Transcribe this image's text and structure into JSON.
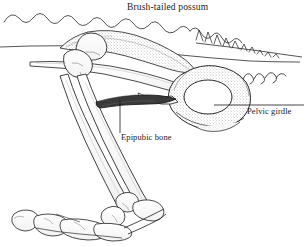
{
  "figure": {
    "title": "Brush-tailed possum",
    "background_color": "#ffffff",
    "ink_color": "#1a1a1a",
    "stipple_color": "#9a9a9a"
  },
  "labels": {
    "title": "Brush-tailed possum",
    "pelvic_girdle": "Pelvic girdle",
    "epipubic_bone": "Epipubic bone"
  },
  "annotations": [
    {
      "name": "pelvic-girdle",
      "text": "Pelvic girdle",
      "leader": "horizontal",
      "leader_from": [
        214,
        105
      ],
      "leader_to": [
        304,
        105
      ]
    },
    {
      "name": "epipubic-bone",
      "text": "Epipubic bone",
      "leader": "vertical",
      "leader_from": [
        120,
        100
      ],
      "leader_to": [
        120,
        133
      ]
    }
  ],
  "structures": [
    {
      "name": "dorsal-body-outline",
      "description": "wavy dorsal contour line across upper area"
    },
    {
      "name": "vertebral-spines",
      "description": "jagged spinous processes right of mid-back"
    },
    {
      "name": "tail-vertebrae",
      "description": "small curled caudal vertebrae at right"
    },
    {
      "name": "ilium",
      "description": "long tapering blade running down-right with stipple"
    },
    {
      "name": "pelvic-girdle",
      "description": "pelvis with large oval obturator foramen, stippled"
    },
    {
      "name": "epipubic-bone",
      "description": "dark curved rod projecting forward from pubis"
    },
    {
      "name": "femur",
      "description": "long bone from hip joint descending left"
    },
    {
      "name": "tibia-fibula",
      "description": "paired lower leg bones descending to ankle"
    },
    {
      "name": "ankle-joint",
      "description": "tarsal cluster at lower middle"
    },
    {
      "name": "foot-bones",
      "description": "metatarsals and phalanges at lower left"
    }
  ]
}
